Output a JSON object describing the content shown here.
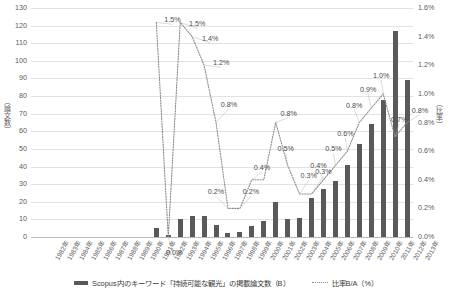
{
  "axes": {
    "y_left_title": "（論文数）",
    "y_right_title": "（比率）",
    "y_left_ticks": [
      "0",
      "10",
      "20",
      "30",
      "40",
      "50",
      "60",
      "70",
      "80",
      "90",
      "100",
      "110",
      "120",
      "130"
    ],
    "y_right_ticks": [
      "0.0%",
      "0.2%",
      "0.4%",
      "0.6%",
      "0.8%",
      "1.0%",
      "1.2%",
      "1.4%",
      "1.6%"
    ]
  },
  "legend": {
    "bar_label": "Scopus内のキーワード「持続可能な観光」の掲載論文数（B）",
    "line_label": "比率B/A（%）",
    "bar_icon": "bar-swatch-icon",
    "line_icon": "dotted-line-swatch-icon"
  },
  "chart_data": {
    "type": "bar",
    "title": "",
    "subtitle": "",
    "xlabel": "",
    "ylabel": "（論文数）",
    "y2label": "（比率）",
    "ylim": [
      0,
      130
    ],
    "y2lim": [
      0,
      1.6
    ],
    "grid": true,
    "legend_position": "bottom",
    "categories": [
      "1982年",
      "1983年",
      "1984年",
      "1985年",
      "1986年",
      "1987年",
      "1988年",
      "1989年",
      "1990年",
      "1991年",
      "1992年",
      "1993年",
      "1994年",
      "1995年",
      "1996年",
      "1997年",
      "1998年",
      "1999年",
      "2000年",
      "2001年",
      "2002年",
      "2003年",
      "2004年",
      "2005年",
      "2006年",
      "2007年",
      "2008年",
      "2009年",
      "2010年",
      "2011年",
      "2012年",
      "2013年"
    ],
    "series": [
      {
        "name": "Scopus内のキーワード「持続可能な観光」の掲載論文数（B）",
        "type": "bar",
        "axis": "left",
        "color": "#595959",
        "values": [
          0,
          0,
          0,
          0,
          0,
          0,
          0,
          0,
          0,
          0,
          5,
          1,
          10,
          12,
          12,
          7,
          2,
          3,
          6,
          9,
          20,
          10,
          11,
          22,
          27,
          32,
          41,
          53,
          64,
          78,
          117,
          89
        ]
      },
      {
        "name": "比率B/A（%）",
        "type": "line",
        "axis": "right",
        "color": "#8a8a8a",
        "style": "dotted",
        "values": [
          null,
          null,
          null,
          null,
          null,
          null,
          null,
          null,
          null,
          null,
          1.5,
          0.0,
          1.5,
          1.4,
          1.2,
          0.8,
          0.2,
          0.2,
          0.4,
          0.4,
          0.8,
          0.5,
          0.3,
          0.3,
          0.4,
          0.5,
          0.6,
          0.8,
          0.9,
          1.0,
          0.7,
          0.8
        ]
      }
    ],
    "point_labels": [
      {
        "index": 10,
        "text": "1.5%"
      },
      {
        "index": 11,
        "text": "0.0%"
      },
      {
        "index": 12,
        "text": "1.5%"
      },
      {
        "index": 13,
        "text": "1.4%"
      },
      {
        "index": 14,
        "text": "1.2%"
      },
      {
        "index": 15,
        "text": "0.8%"
      },
      {
        "index": 16,
        "text": "0.2%"
      },
      {
        "index": 17,
        "text": "0.2%"
      },
      {
        "index": 18,
        "text": "0.4%"
      },
      {
        "index": 20,
        "text": "0.8%"
      },
      {
        "index": 21,
        "text": "0.5%"
      },
      {
        "index": 22,
        "text": "0.3%"
      },
      {
        "index": 23,
        "text": "0.3%"
      },
      {
        "index": 24,
        "text": "0.4%"
      },
      {
        "index": 25,
        "text": "0.5%"
      },
      {
        "index": 26,
        "text": "0.6%"
      },
      {
        "index": 27,
        "text": "0.8%"
      },
      {
        "index": 28,
        "text": "0.9%"
      },
      {
        "index": 29,
        "text": "1.0%"
      },
      {
        "index": 30,
        "text": "0.7%"
      },
      {
        "index": 31,
        "text": "0.8%"
      }
    ],
    "label_offsets": [
      {
        "index": 10,
        "dx": 16,
        "dy": -2
      },
      {
        "index": 11,
        "dx": 6,
        "dy": 16
      },
      {
        "index": 12,
        "dx": 17,
        "dy": 2
      },
      {
        "index": 13,
        "dx": 18,
        "dy": 2
      },
      {
        "index": 14,
        "dx": 17,
        "dy": -2
      },
      {
        "index": 15,
        "dx": 13,
        "dy": -18
      },
      {
        "index": 16,
        "dx": -12,
        "dy": -16
      },
      {
        "index": 17,
        "dx": 11,
        "dy": -16
      },
      {
        "index": 18,
        "dx": 10,
        "dy": -12
      },
      {
        "index": 20,
        "dx": 13,
        "dy": -9
      },
      {
        "index": 21,
        "dx": -2,
        "dy": -16
      },
      {
        "index": 22,
        "dx": 9,
        "dy": -18
      },
      {
        "index": 23,
        "dx": 12,
        "dy": -22
      },
      {
        "index": 24,
        "dx": -5,
        "dy": -14
      },
      {
        "index": 25,
        "dx": -2,
        "dy": -16
      },
      {
        "index": 26,
        "dx": -2,
        "dy": -17
      },
      {
        "index": 27,
        "dx": -5,
        "dy": -17
      },
      {
        "index": 28,
        "dx": -3,
        "dy": -18
      },
      {
        "index": 29,
        "dx": -2,
        "dy": -18
      },
      {
        "index": 30,
        "dx": 4,
        "dy": -17
      },
      {
        "index": 31,
        "dx": 13,
        "dy": -12
      }
    ]
  }
}
